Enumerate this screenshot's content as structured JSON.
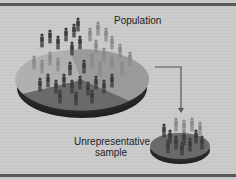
{
  "diagram": {
    "labels": {
      "population": "Population",
      "sample_line1": "Unrepresentative",
      "sample_line2": "sample"
    },
    "colors": {
      "background": "#c9c9c9",
      "rule": "#5a5a5a",
      "pie_light_slice": "#b4b4b4",
      "pie_mid_slice": "#8c8c8c",
      "pie_dark_slice": "#6e6e6e",
      "pie_base": "#3a3a3a",
      "figure_dark": "#3c3c3c",
      "figure_light": "#9a9a9a",
      "arrow": "#555555"
    },
    "nodes": [
      {
        "id": "population",
        "shape": "pie-disc",
        "label": "Population"
      },
      {
        "id": "sample",
        "shape": "pie-disc-small",
        "label": "Unrepresentative sample"
      }
    ],
    "edges": [
      {
        "from": "population",
        "to": "sample",
        "style": "elbow-arrow"
      }
    ]
  }
}
